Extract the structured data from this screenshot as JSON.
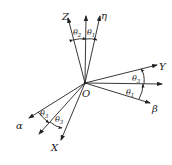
{
  "diagram": {
    "origin_label": "O",
    "axes": [
      {
        "id": "Z",
        "label": "Z"
      },
      {
        "id": "vertical",
        "label": ""
      },
      {
        "id": "eta",
        "label": "η"
      },
      {
        "id": "Y",
        "label": "Y"
      },
      {
        "id": "horizontal",
        "label": ""
      },
      {
        "id": "beta",
        "label": "β"
      },
      {
        "id": "alpha",
        "label": "α"
      },
      {
        "id": "middle",
        "label": ""
      },
      {
        "id": "X",
        "label": "X"
      }
    ],
    "angles": [
      {
        "symbol": "θ",
        "sub": "2",
        "between": "Z-vertical"
      },
      {
        "symbol": "θ",
        "sub": "1",
        "between": "vertical-eta"
      },
      {
        "symbol": "θ",
        "sub": "3",
        "between": "Y-horizontal"
      },
      {
        "symbol": "θ",
        "sub": "1",
        "between": "horizontal-beta"
      },
      {
        "symbol": "θ",
        "sub": "3",
        "between": "alpha-middle"
      },
      {
        "symbol": "θ",
        "sub": "3",
        "between": "middle-X"
      }
    ],
    "colors": {
      "line": "#222222",
      "background": "#ffffff"
    }
  }
}
